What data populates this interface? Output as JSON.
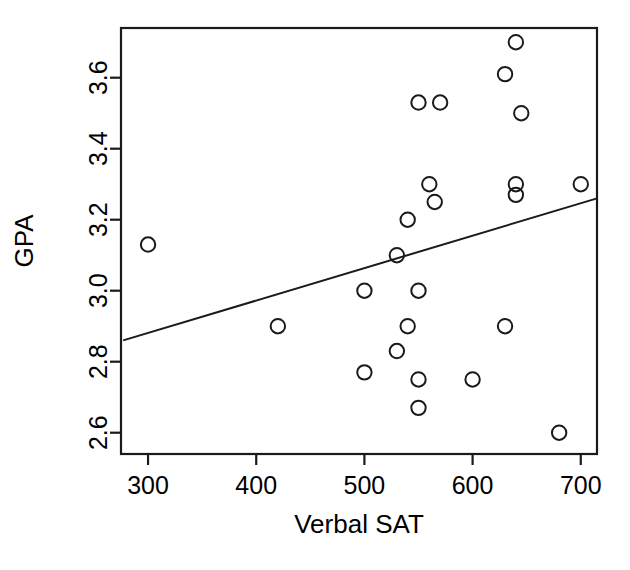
{
  "chart_data": {
    "type": "scatter",
    "title": "",
    "xlabel": "Verbal SAT",
    "ylabel": "GPA",
    "xlim": [
      275,
      715
    ],
    "ylim": [
      2.54,
      3.74
    ],
    "xticks": [
      300,
      400,
      500,
      600,
      700
    ],
    "xtick_labels": [
      "300",
      "400",
      "500",
      "600",
      "700"
    ],
    "yticks": [
      2.6,
      2.8,
      3.0,
      3.2,
      3.4,
      3.6
    ],
    "ytick_labels": [
      "2.6",
      "2.8",
      "3.0",
      "3.2",
      "3.4",
      "3.6"
    ],
    "grid": false,
    "legend": null,
    "marker": "open-circle",
    "points": [
      {
        "x": 300,
        "y": 3.13
      },
      {
        "x": 420,
        "y": 2.9
      },
      {
        "x": 500,
        "y": 3.0
      },
      {
        "x": 500,
        "y": 2.77
      },
      {
        "x": 530,
        "y": 3.1
      },
      {
        "x": 530,
        "y": 2.83
      },
      {
        "x": 540,
        "y": 3.2
      },
      {
        "x": 540,
        "y": 2.9
      },
      {
        "x": 550,
        "y": 3.53
      },
      {
        "x": 550,
        "y": 3.0
      },
      {
        "x": 550,
        "y": 2.75
      },
      {
        "x": 550,
        "y": 2.67
      },
      {
        "x": 560,
        "y": 3.3
      },
      {
        "x": 565,
        "y": 3.25
      },
      {
        "x": 570,
        "y": 3.53
      },
      {
        "x": 600,
        "y": 2.75
      },
      {
        "x": 630,
        "y": 3.61
      },
      {
        "x": 630,
        "y": 2.9
      },
      {
        "x": 640,
        "y": 3.7
      },
      {
        "x": 640,
        "y": 3.3
      },
      {
        "x": 640,
        "y": 3.27
      },
      {
        "x": 645,
        "y": 3.5
      },
      {
        "x": 680,
        "y": 2.6
      },
      {
        "x": 700,
        "y": 3.3
      }
    ],
    "regression_line": {
      "x_start": 277,
      "y_start": 2.86,
      "x_end": 715,
      "y_end": 3.26
    }
  }
}
